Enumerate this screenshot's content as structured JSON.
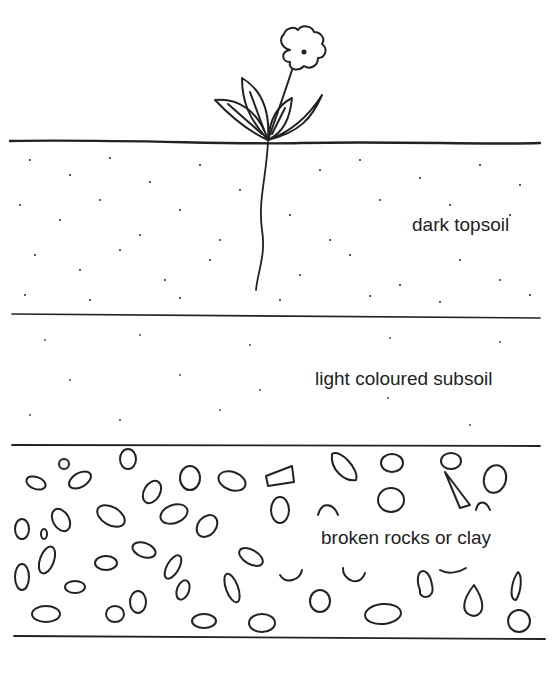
{
  "diagram": {
    "type": "soil-profile",
    "layers": [
      {
        "id": "topsoil",
        "label": "dark topsoil",
        "texture": "dense dots"
      },
      {
        "id": "subsoil",
        "label": "light coloured subsoil",
        "texture": "sparse dots"
      },
      {
        "id": "rock",
        "label": "broken rocks or clay",
        "texture": "pebble outlines"
      }
    ],
    "surface_feature": "flowering plant with root",
    "colors": {
      "line": "#222222",
      "background": "#ffffff"
    }
  }
}
